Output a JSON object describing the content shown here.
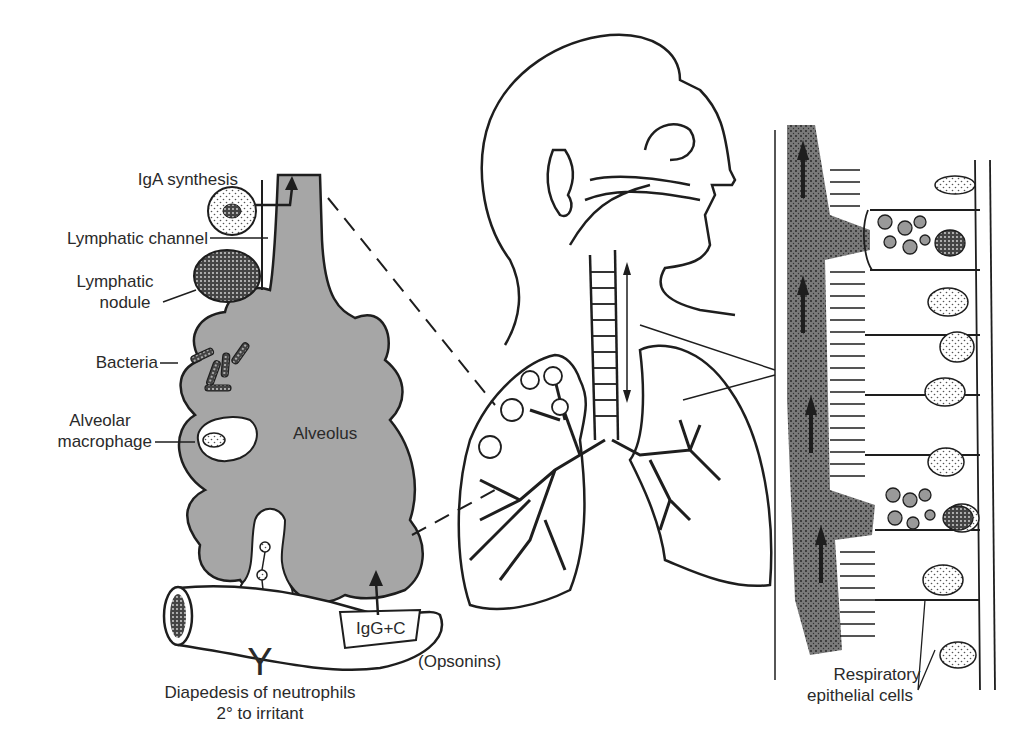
{
  "colors": {
    "alveolus_fill": "#a6a6a6",
    "mucus_fill": "#6e6e6e",
    "line": "#1e1e1e",
    "background": "#ffffff"
  },
  "labels": {
    "iga_synthesis": "IgA synthesis",
    "lymphatic_channel": "Lymphatic channel",
    "lymphatic_nodule_line1": "Lymphatic",
    "lymphatic_nodule_line2": "nodule",
    "bacteria": "Bacteria",
    "alveolar_macrophage_line1": "Alveolar",
    "alveolar_macrophage_line2": "macrophage",
    "alveolus": "Alveolus",
    "igg_c": "IgG+C",
    "opsonins": "(Opsonins)",
    "antibody_symbol": "Y",
    "diapedesis_line1": "Diapedesis of neutrophils",
    "diapedesis_line2": "2° to irritant",
    "respiratory_line1": "Respiratory",
    "respiratory_line2": "epithelial cells"
  }
}
